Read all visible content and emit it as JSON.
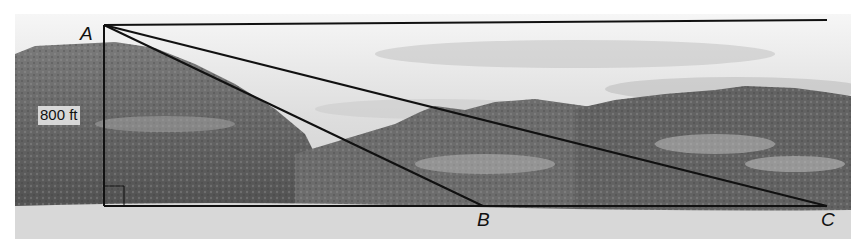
{
  "diagram": {
    "type": "angle-of-depression figure over landscape photo",
    "points": {
      "A": {
        "label": "A"
      },
      "B": {
        "label": "B"
      },
      "C": {
        "label": "C"
      }
    },
    "measurements": {
      "height": "800 ft"
    },
    "colors": {
      "line": "#111111",
      "sky": "#ebebeb",
      "ground": "#d9d9d9",
      "terrain_dark": "#555555"
    }
  }
}
